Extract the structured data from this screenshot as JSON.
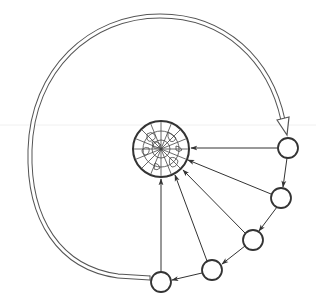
{
  "diagram": {
    "colors": {
      "stroke": "#333333",
      "arc": "#555555",
      "background": "#ffffff",
      "guide_line": "#eeeeee"
    },
    "globe": {
      "cx": 161,
      "cy": 149,
      "r": 28,
      "icon": "globe-icon"
    },
    "nodes": [
      {
        "id": "n1",
        "cx": 288,
        "cy": 148,
        "r": 10
      },
      {
        "id": "n2",
        "cx": 281,
        "cy": 198,
        "r": 10
      },
      {
        "id": "n3",
        "cx": 253,
        "cy": 240,
        "r": 10
      },
      {
        "id": "n4",
        "cx": 212,
        "cy": 270,
        "r": 10
      },
      {
        "id": "n5",
        "cx": 161,
        "cy": 282,
        "r": 10
      }
    ],
    "return_arc": {
      "style": "double-line",
      "arrowhead": "hollow"
    }
  }
}
